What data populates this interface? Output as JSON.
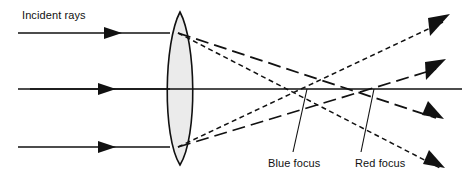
{
  "figure": {
    "width": 470,
    "height": 183,
    "background": "#ffffff"
  },
  "labels": {
    "incident_rays": "Incident rays",
    "blue_focus": "Blue focus",
    "red_focus": "Red focus"
  },
  "colors": {
    "stroke": "#111111",
    "lens_fill": "#ebebeb",
    "lens_stroke": "#111111",
    "background": "#ffffff"
  },
  "diagram_data": {
    "type": "ray-diagram",
    "optical_axis": {
      "y": 89,
      "x_start": 30,
      "x_end": 462
    },
    "lens": {
      "shape": "biconvex",
      "center_x": 180,
      "top_apex_y": 12,
      "bottom_apex_y": 165,
      "half_thickness": 18,
      "fill": "#ebebeb"
    },
    "incident_rays": [
      {
        "name": "upper-incident-ray",
        "y": 33,
        "x_start": 18,
        "x_end": 168,
        "arrow_x": 116
      },
      {
        "name": "axial-incident-ray",
        "y": 89,
        "x_start": 18,
        "x_end": 168,
        "arrow_x": 112
      },
      {
        "name": "lower-incident-ray",
        "y": 147,
        "x_start": 18,
        "x_end": 168,
        "arrow_x": 112
      }
    ],
    "foci": [
      {
        "name": "blue-focus",
        "x": 307,
        "y": 89,
        "dash_style": "short-dash"
      },
      {
        "name": "red-focus",
        "x": 374,
        "y": 89,
        "dash_style": "long-dash"
      }
    ],
    "refracted_rays": [
      {
        "name": "upper-blue-ray",
        "from": [
          178,
          33
        ],
        "focus": [
          307,
          89
        ],
        "to": [
          443,
          172
        ],
        "dash": "short"
      },
      {
        "name": "upper-red-ray",
        "from": [
          178,
          33
        ],
        "focus": [
          374,
          89
        ],
        "to": [
          445,
          121
        ],
        "dash": "long"
      },
      {
        "name": "lower-blue-ray",
        "from": [
          178,
          147
        ],
        "focus": [
          307,
          89
        ],
        "to": [
          450,
          16
        ],
        "dash": "short"
      },
      {
        "name": "lower-red-ray",
        "from": [
          178,
          147
        ],
        "focus": [
          374,
          89
        ],
        "to": [
          446,
          62
        ],
        "dash": "long"
      }
    ],
    "leader_lines": [
      {
        "name": "blue-focus-leader",
        "from": [
          307,
          89
        ],
        "to": [
          293,
          152
        ]
      },
      {
        "name": "red-focus-leader",
        "from": [
          374,
          89
        ],
        "to": [
          361,
          152
        ]
      }
    ]
  }
}
